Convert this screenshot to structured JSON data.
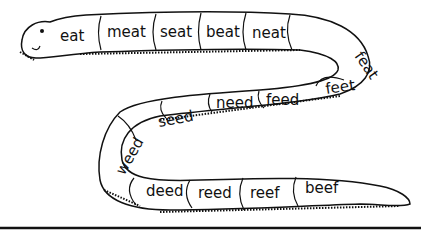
{
  "segments": {
    "top": [
      "eat",
      "meat",
      "seat",
      "beat",
      "neat",
      "feat"
    ],
    "middle": [
      "feet",
      "feed",
      "need",
      "seed",
      "weed"
    ],
    "bottom": [
      "deed",
      "reed",
      "reef",
      "beef"
    ]
  },
  "colors": {
    "ink": "#111111",
    "background": "#ffffff"
  }
}
